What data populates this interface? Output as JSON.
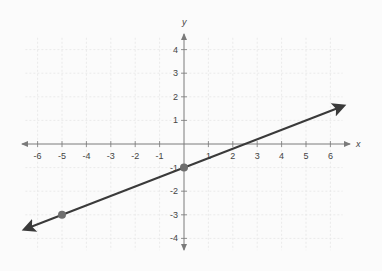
{
  "chart_data": {
    "type": "line",
    "title": "",
    "xlabel": "x",
    "ylabel": "y",
    "xlim": [
      -6.5,
      6.5
    ],
    "ylim": [
      -4.5,
      4.5
    ],
    "grid": true,
    "x_ticks": [
      -6,
      -5,
      -4,
      -3,
      -2,
      -1,
      1,
      2,
      3,
      4,
      5,
      6
    ],
    "y_ticks": [
      4,
      3,
      2,
      1,
      -1,
      -2,
      -3,
      -4
    ],
    "series": [
      {
        "name": "line",
        "equation": "y = 0.4x - 1",
        "slope": 0.4,
        "intercept": -1,
        "color": "#3a3a3a",
        "arrows_both_ends": true,
        "x": [
          -6.5,
          6.5
        ],
        "y": [
          -3.6,
          1.6
        ]
      }
    ],
    "points": [
      {
        "x": 0,
        "y": -1,
        "color": "#6e6e6e"
      },
      {
        "x": -5,
        "y": -3,
        "color": "#6e6e6e"
      }
    ]
  },
  "labels": {
    "x_axis": "x",
    "y_axis": "y"
  },
  "colors": {
    "axis": "#7a7a7a",
    "grid": "#e6e6e6",
    "line": "#3a3a3a",
    "point": "#6e6e6e"
  }
}
